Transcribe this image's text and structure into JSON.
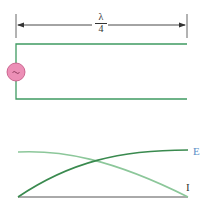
{
  "dimension": {
    "numerator": "λ",
    "denominator": "4"
  },
  "source": {
    "icon": "ac-source-icon",
    "symbol": "~",
    "fill": "#ec8fb6",
    "stroke": "#c2507f"
  },
  "line": {
    "color": "#3f9a62"
  },
  "graph": {
    "e_label": "E",
    "i_label": "I",
    "e_color": "#3a8a4f",
    "i_color": "#8cc79a",
    "label_color": "#5a8fc8",
    "baseline_color": "#555555"
  }
}
